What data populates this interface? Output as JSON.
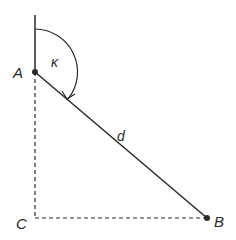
{
  "diagram": {
    "type": "geometry",
    "colors": {
      "line": "#2a2a2a",
      "background": "#ffffff"
    },
    "points": {
      "A": {
        "label": "A",
        "x": 35,
        "y": 72,
        "marker": true
      },
      "B": {
        "label": "B",
        "x": 207,
        "y": 218,
        "marker": true
      },
      "C": {
        "label": "C",
        "x": 35,
        "y": 218,
        "marker": false
      }
    },
    "segments": [
      {
        "name": "vertical-reference",
        "from": [
          35,
          15
        ],
        "to": [
          35,
          72
        ],
        "style": "solid"
      },
      {
        "name": "distance-d",
        "from": "A",
        "to": "B",
        "style": "solid",
        "label": "d"
      },
      {
        "name": "dashed-AC",
        "from": "A",
        "to": "C",
        "style": "dashed"
      },
      {
        "name": "dashed-CB",
        "from": "C",
        "to": "B",
        "style": "dashed"
      }
    ],
    "angle": {
      "label": "κ",
      "vertex": "A",
      "from": "vertical-reference",
      "to": "distance-d",
      "direction": "clockwise"
    },
    "labels": {
      "A": "A",
      "B": "B",
      "C": "C",
      "d": "d",
      "kappa": "κ"
    }
  }
}
